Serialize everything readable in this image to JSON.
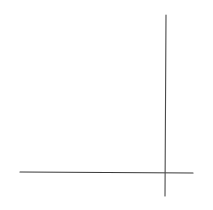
{
  "canvas": {
    "width": 213,
    "height": 210,
    "background": "#ffffff"
  },
  "lines": [
    {
      "id": "horizontal-line",
      "x1": 20,
      "y1": 172,
      "x2": 193,
      "y2": 173,
      "color": "#3a3a3a",
      "width": 1.2
    },
    {
      "id": "vertical-line",
      "x1": 166,
      "y1": 15,
      "x2": 165,
      "y2": 196,
      "color": "#4a4a4a",
      "width": 1.1
    }
  ]
}
